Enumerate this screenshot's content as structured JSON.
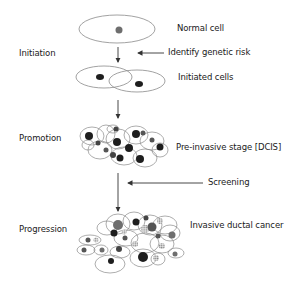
{
  "diagram": {
    "stages": [
      {
        "label": "Initiation"
      },
      {
        "label": "Promotion"
      },
      {
        "label": "Progression"
      }
    ],
    "cell_labels": [
      {
        "label": "Normal cell"
      },
      {
        "label": "Initiated cells"
      },
      {
        "label": "Pre-invasive stage [DCIS]"
      },
      {
        "label": "Invasive ductal cancer"
      }
    ],
    "interventions": [
      {
        "label": "Identify genetic risk"
      },
      {
        "label": "Screening"
      }
    ],
    "colors": {
      "outline": "#8a8a8a",
      "nucleus_dark": "#1e1e1e",
      "nucleus_gray": "#6e6e6e",
      "nucleus_dotted": "#b5b5b5",
      "arrow": "#333333",
      "text": "#1a1a1a"
    }
  }
}
